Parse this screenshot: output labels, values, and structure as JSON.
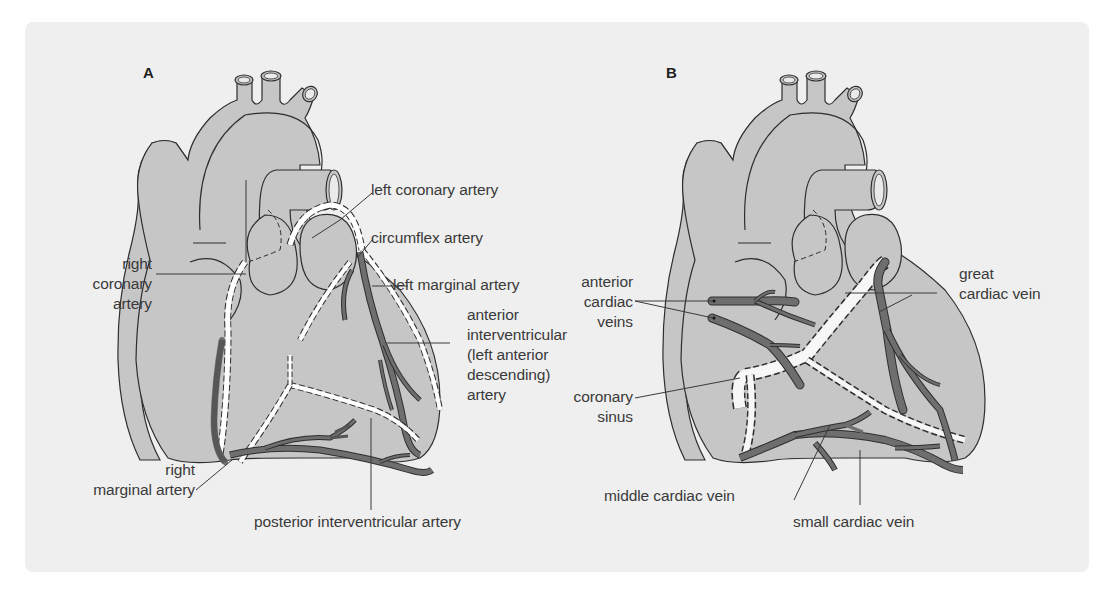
{
  "figure": {
    "colors": {
      "background": "#ffffff",
      "panel": "#efefef",
      "heart_fill": "#c6c6c6",
      "heart_outline": "#2e2e2e",
      "vessel_dark": "#6e6e6e",
      "artery_path": "#ffffff",
      "label_text": "#3a3a3a"
    },
    "panels": [
      {
        "letter": "A",
        "subject": "coronary arteries",
        "labels": {
          "right_coronary_artery": [
            "right",
            "coronary",
            "artery"
          ],
          "left_coronary_artery": "left coronary artery",
          "circumflex_artery": "circumflex artery",
          "left_marginal_artery": "left marginal artery",
          "anterior_interventricular": [
            "anterior",
            "interventricular",
            "(left anterior",
            "descending)",
            "artery"
          ],
          "right_marginal_artery": [
            "right",
            "marginal artery"
          ],
          "posterior_interventricular_artery": "posterior interventricular artery"
        }
      },
      {
        "letter": "B",
        "subject": "cardiac veins",
        "labels": {
          "anterior_cardiac_veins": [
            "anterior",
            "cardiac",
            "veins"
          ],
          "coronary_sinus": [
            "coronary",
            "sinus"
          ],
          "great_cardiac_vein": [
            "great",
            "cardiac vein"
          ],
          "middle_cardiac_vein": "middle cardiac vein",
          "small_cardiac_vein": "small cardiac vein"
        }
      }
    ]
  }
}
